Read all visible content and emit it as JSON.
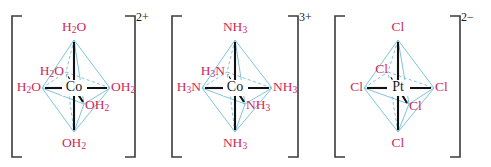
{
  "figure": {
    "background_color": "#ffffff",
    "ligand_label_color": "#d1295c",
    "metal_label_color": "#1a1a1a",
    "octahedron_edge_color": "#7fc4de",
    "bond_color": "#111111",
    "bracket_color": "#3b3b3b"
  },
  "complexes": [
    {
      "id": "hexaaquacobalt",
      "metal": "Co",
      "charge": "2+",
      "ligand_positions": {
        "top": "H2O",
        "bottom": "OH2",
        "left": "H2O",
        "right": "OH2",
        "inner_back": "H2O",
        "inner_front": "OH2"
      },
      "labels": {
        "top": {
          "main": "H",
          "sub": "2",
          "tail": "O"
        },
        "bottom": {
          "main": "OH",
          "sub": "2",
          "tail": ""
        },
        "left": {
          "main": "H",
          "sub": "2",
          "tail": "O"
        },
        "right": {
          "main": "OH",
          "sub": "2",
          "tail": ""
        },
        "inner_back": {
          "main": "H",
          "sub": "2",
          "tail": "O"
        },
        "inner_front": {
          "main": "OH",
          "sub": "2",
          "tail": ""
        }
      }
    },
    {
      "id": "hexaamminecobalt",
      "metal": "Co",
      "charge": "3+",
      "ligand_positions": {
        "top": "NH3",
        "bottom": "NH3",
        "left": "H3N",
        "right": "NH3",
        "inner_back": "H3N",
        "inner_front": "NH3"
      },
      "labels": {
        "top": {
          "main": "NH",
          "sub": "3",
          "tail": ""
        },
        "bottom": {
          "main": "NH",
          "sub": "3",
          "tail": ""
        },
        "left": {
          "main": "H",
          "sub": "3",
          "tail": "N"
        },
        "right": {
          "main": "NH",
          "sub": "3",
          "tail": ""
        },
        "inner_back": {
          "main": "H",
          "sub": "3",
          "tail": "N"
        },
        "inner_front": {
          "main": "NH",
          "sub": "3",
          "tail": ""
        }
      }
    },
    {
      "id": "hexachloroplatinate",
      "metal": "Pt",
      "charge": "2−",
      "ligand_positions": {
        "top": "Cl",
        "bottom": "Cl",
        "left": "Cl",
        "right": "Cl",
        "inner_back": "Cl",
        "inner_front": "Cl"
      },
      "labels": {
        "top": {
          "main": "Cl",
          "sub": "",
          "tail": ""
        },
        "bottom": {
          "main": "Cl",
          "sub": "",
          "tail": ""
        },
        "left": {
          "main": "Cl",
          "sub": "",
          "tail": ""
        },
        "right": {
          "main": "Cl",
          "sub": "",
          "tail": ""
        },
        "inner_back": {
          "main": "Cl",
          "sub": "",
          "tail": ""
        },
        "inner_front": {
          "main": "Cl",
          "sub": "",
          "tail": ""
        }
      }
    }
  ]
}
